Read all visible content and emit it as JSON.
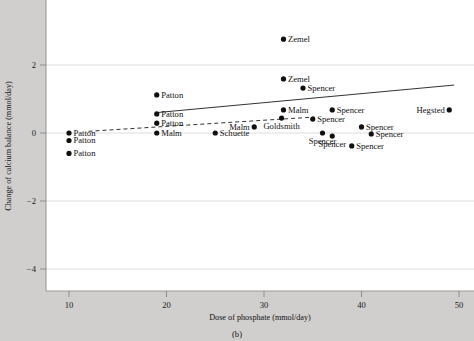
{
  "figure": {
    "caption": "(b)",
    "background_color": "#d0cfcd",
    "plot_background_color": "#ffffff"
  },
  "chart_data": {
    "type": "scatter",
    "title": "",
    "xlabel": "Dose of phosphate (mmol/day)",
    "ylabel": "Change of calcium balance (mmol/day)",
    "xlim": [
      8.5,
      51.5
    ],
    "ylim": [
      -4.6,
      3.4
    ],
    "xticks": [
      10,
      20,
      30,
      40,
      50
    ],
    "xtick_labels": [
      "10",
      "20",
      "30",
      "40",
      "50"
    ],
    "yticks": [
      2,
      0,
      -2,
      -4
    ],
    "ytick_labels": [
      "2",
      "0",
      "−2",
      "−4"
    ],
    "grid": "horizontal",
    "legend": "none",
    "points": [
      {
        "label": "Patton",
        "x": 10.0,
        "y": 0.0,
        "label_side": "right"
      },
      {
        "label": "Patton",
        "x": 10.0,
        "y": -0.22,
        "label_side": "right"
      },
      {
        "label": "Patton",
        "x": 10.0,
        "y": -0.6,
        "label_side": "right"
      },
      {
        "label": "Patton",
        "x": 19.0,
        "y": 1.12,
        "label_side": "right"
      },
      {
        "label": "Patton",
        "x": 19.0,
        "y": 0.56,
        "label_side": "right"
      },
      {
        "label": "Patton",
        "x": 19.0,
        "y": 0.29,
        "label_side": "right"
      },
      {
        "label": "Malm",
        "x": 19.0,
        "y": 0.0,
        "label_side": "right"
      },
      {
        "label": "Schuette",
        "x": 25.0,
        "y": 0.0,
        "label_side": "right"
      },
      {
        "label": "Malm",
        "x": 29.0,
        "y": 0.18,
        "label_side": "left"
      },
      {
        "label": "Zemel",
        "x": 32.0,
        "y": 2.76,
        "label_side": "right"
      },
      {
        "label": "Zemel",
        "x": 32.0,
        "y": 1.59,
        "label_side": "right"
      },
      {
        "label": "Malm",
        "x": 32.0,
        "y": 0.68,
        "label_side": "right"
      },
      {
        "label": "Goldsmith",
        "x": 31.8,
        "y": 0.44,
        "label_side": "below"
      },
      {
        "label": "Spencer",
        "x": 34.0,
        "y": 1.32,
        "label_side": "right"
      },
      {
        "label": "Spencer",
        "x": 35.0,
        "y": 0.41,
        "label_side": "right"
      },
      {
        "label": "Spencer",
        "x": 36.0,
        "y": 0.0,
        "label_side": "below"
      },
      {
        "label": "Spencer",
        "x": 37.0,
        "y": 0.68,
        "label_side": "right"
      },
      {
        "label": "Spencer",
        "x": 37.0,
        "y": -0.09,
        "label_side": "below"
      },
      {
        "label": "Spencer",
        "x": 39.0,
        "y": -0.38,
        "label_side": "right"
      },
      {
        "label": "Spencer",
        "x": 40.0,
        "y": 0.18,
        "label_side": "right"
      },
      {
        "label": "Spencer",
        "x": 41.0,
        "y": -0.03,
        "label_side": "right"
      },
      {
        "label": "Hegsted",
        "x": 49.0,
        "y": 0.68,
        "label_side": "left"
      }
    ],
    "fit_lines": [
      {
        "name": "solid-regression-line",
        "style": "solid",
        "x_start": 19.0,
        "y_start": 0.6,
        "x_end": 49.5,
        "y_end": 1.41
      },
      {
        "name": "dashed-regression-line",
        "style": "dashed",
        "x_start": 12.0,
        "y_start": 0.05,
        "x_end": 35.2,
        "y_end": 0.47
      }
    ]
  }
}
